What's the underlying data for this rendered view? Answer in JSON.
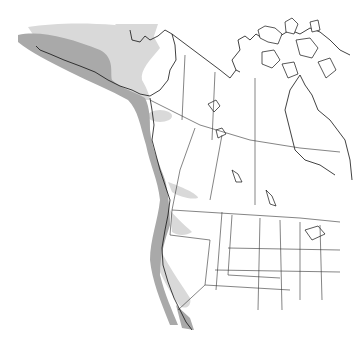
{
  "map": {
    "type": "species range map",
    "region": "Western North America",
    "colors": {
      "background": "#ffffff",
      "outline": "#111111",
      "range_primary": "#a9a9a9",
      "range_secondary": "#d9d9d9"
    },
    "legend": [],
    "labels": []
  }
}
